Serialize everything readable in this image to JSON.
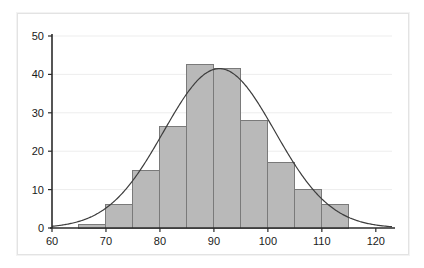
{
  "chart_data": {
    "type": "bar",
    "title": "",
    "subtitle": "",
    "xlabel": "",
    "ylabel": "",
    "xlim": [
      60,
      123
    ],
    "ylim": [
      0,
      50
    ],
    "grid": true,
    "legend": null,
    "bin_width": 5,
    "bin_edges": [
      60,
      65,
      70,
      75,
      80,
      85,
      90,
      95,
      100,
      105,
      110,
      115,
      120
    ],
    "categories": [
      "60-65",
      "65-70",
      "70-75",
      "75-80",
      "80-85",
      "85-90",
      "90-95",
      "95-100",
      "100-105",
      "105-110",
      "110-115",
      "115-120"
    ],
    "values": [
      0,
      1,
      6,
      15,
      26.5,
      42.5,
      41.5,
      28,
      17,
      10,
      6,
      0
    ],
    "xticks": [
      60,
      70,
      80,
      90,
      100,
      110,
      120
    ],
    "xtick_labels": [
      "60",
      "70",
      "80",
      "90",
      "100",
      "110",
      "120"
    ],
    "yticks": [
      0,
      10,
      20,
      30,
      40,
      50
    ],
    "ytick_labels": [
      "0",
      "10",
      "20",
      "30",
      "40",
      "50"
    ],
    "series": [
      {
        "name": "histogram",
        "type": "bar",
        "values": [
          0,
          1,
          6,
          15,
          26.5,
          42.5,
          41.5,
          28,
          17,
          10,
          6,
          0
        ]
      },
      {
        "name": "normal-curve",
        "type": "line",
        "peak_x": 91,
        "peak_y": 41.5,
        "mean": 91,
        "std": 10.3,
        "amplitude": 41.5
      }
    ],
    "colors": {
      "bar_fill": "#b9b9b9",
      "bar_stroke": "#7a7a7a",
      "curve": "#3d3d3d",
      "axis": "#2b2b2b",
      "grid": "#ededed",
      "background": "#ffffff",
      "frame": "#e3e3e3",
      "tick_text": "#1a1a1a"
    }
  }
}
